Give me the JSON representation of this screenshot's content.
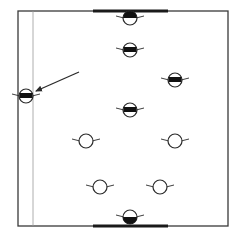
{
  "diagram": {
    "type": "field-formation",
    "width": 238,
    "height": 241,
    "colors": {
      "background": "#ffffff",
      "frame": "#3a3a3a",
      "thin_line": "#9a9a9a",
      "goal_bar": "#1a1a1a",
      "marker_stroke": "#2a2a2a",
      "marker_fill": "#111111",
      "arrow": "#2a2a2a"
    },
    "field": {
      "x": 18,
      "y": 11,
      "w": 210,
      "h": 215
    },
    "side_line": {
      "x": 33,
      "y1": 11,
      "y2": 226
    },
    "goal_bars": [
      {
        "name": "top-goal-bar",
        "x1": 93,
        "x2": 168,
        "y": 11
      },
      {
        "name": "bottom-goal-bar",
        "x1": 93,
        "x2": 168,
        "y": 226
      }
    ],
    "arrow": {
      "x1": 79,
      "y1": 72,
      "x2": 36,
      "y2": 91
    },
    "players": [
      {
        "id": "p1",
        "x": 130,
        "y": 18,
        "fill": "top-half",
        "team": "dark"
      },
      {
        "id": "p2",
        "x": 130,
        "y": 50,
        "fill": "band",
        "team": "dark"
      },
      {
        "id": "p3",
        "x": 175,
        "y": 80,
        "fill": "band",
        "team": "dark"
      },
      {
        "id": "p4",
        "x": 26,
        "y": 96,
        "fill": "band",
        "team": "dark",
        "highlighted": true
      },
      {
        "id": "p5",
        "x": 130,
        "y": 110,
        "fill": "band",
        "team": "dark"
      },
      {
        "id": "p6",
        "x": 86,
        "y": 141,
        "fill": "none",
        "team": "light"
      },
      {
        "id": "p7",
        "x": 175,
        "y": 141,
        "fill": "none",
        "team": "light"
      },
      {
        "id": "p8",
        "x": 100,
        "y": 187,
        "fill": "none",
        "team": "light"
      },
      {
        "id": "p9",
        "x": 160,
        "y": 187,
        "fill": "none",
        "team": "light"
      },
      {
        "id": "p10",
        "x": 130,
        "y": 217,
        "fill": "bottom-half",
        "team": "light"
      }
    ]
  }
}
